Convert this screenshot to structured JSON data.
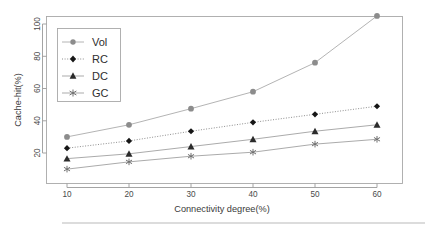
{
  "chart_data": {
    "type": "line",
    "title": "",
    "xlabel": "Connectivity degree(%)",
    "ylabel": "Cache-hit(%)",
    "x": [
      10,
      20,
      30,
      40,
      50,
      60
    ],
    "xticklabels": [
      "10",
      "20",
      "30",
      "40",
      "50",
      "60"
    ],
    "yticks": [
      20,
      40,
      60,
      80,
      100
    ],
    "yticklabels": [
      "20",
      "40",
      "60",
      "80",
      "100"
    ],
    "xlim": [
      5,
      64
    ],
    "ylim": [
      6,
      110
    ],
    "grid": false,
    "legend_position": "upper left",
    "series": [
      {
        "name": "Vol",
        "values": [
          30,
          37.5,
          47.5,
          58,
          76,
          105
        ],
        "marker": "circle",
        "linestyle": "solid",
        "color": "#8c8c8c"
      },
      {
        "name": "RC",
        "values": [
          23,
          27.5,
          33.5,
          39,
          44,
          49
        ],
        "marker": "diamond",
        "linestyle": "dotted",
        "color": "#161616"
      },
      {
        "name": "DC",
        "values": [
          16.5,
          19.5,
          24,
          28.5,
          33.5,
          37.5
        ],
        "marker": "triangle",
        "linestyle": "solid",
        "color": "#2b2b2b"
      },
      {
        "name": "GC",
        "values": [
          10,
          14.5,
          18,
          20.5,
          25.5,
          28.5
        ],
        "marker": "asterisk",
        "linestyle": "solid",
        "color": "#6f6f6f"
      }
    ]
  },
  "legend": {
    "entries": [
      {
        "label": "Vol"
      },
      {
        "label": "RC"
      },
      {
        "label": "DC"
      },
      {
        "label": "GC"
      }
    ]
  },
  "axes": {
    "x_title": "Connectivity degree(%)",
    "y_title": "Cache-hit(%)",
    "x_tick_labels": [
      "10",
      "20",
      "30",
      "40",
      "50",
      "60"
    ],
    "y_tick_labels": [
      "20",
      "40",
      "60",
      "80",
      "100"
    ]
  }
}
